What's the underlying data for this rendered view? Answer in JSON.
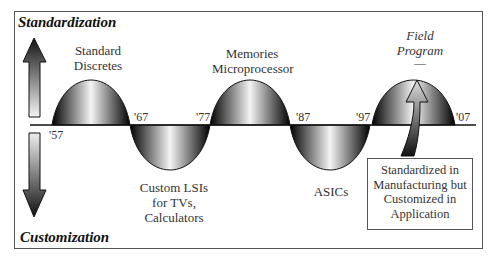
{
  "axes": {
    "top_label": "Standardization",
    "bottom_label": "Customization"
  },
  "years": [
    "'57",
    "'67",
    "'77",
    "'87",
    "'97",
    "'07"
  ],
  "phases": [
    {
      "label_lines": [
        "Standard",
        "Discretes"
      ],
      "side": "up"
    },
    {
      "label_lines": [
        "Custom LSIs",
        "for TVs,",
        "Calculators"
      ],
      "side": "down"
    },
    {
      "label_lines": [
        "Memories",
        "Microprocessor"
      ],
      "side": "up"
    },
    {
      "label_lines": [
        "ASICs"
      ],
      "side": "down"
    },
    {
      "label_lines": [
        "Field",
        "Program",
        "—"
      ],
      "side": "up",
      "italic": true
    }
  ],
  "callout": {
    "lines": [
      "Standardized in",
      "Manufacturing but",
      "Customized in",
      "Application"
    ]
  }
}
